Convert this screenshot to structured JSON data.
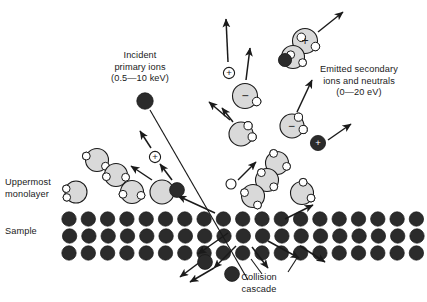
{
  "figure": {
    "type": "scientific-diagram"
  },
  "colors": {
    "dark_atom": "#2b2b2b",
    "molecule_gray": "#d9d9d9",
    "satellite_white": "#ffffff",
    "outline": "#1a1a1a",
    "background": "#ffffff",
    "text": "#1a1a1a"
  },
  "labels": {
    "incident": {
      "line1": "Incident",
      "line2": "primary ions",
      "line3": "(0.5—10 keV)",
      "text": "Incident\nprimary ions\n(0.5—10 keV)"
    },
    "emitted": {
      "line1": "Emitted secondary",
      "line2": "ions and neutrals",
      "line3": "(0—20 eV)",
      "text": "Emitted secondary\nions and neutrals\n(0—20 eV)"
    },
    "uppermost": {
      "line1": "Uppermost",
      "line2": "monolayer",
      "text": "Uppermost\nmonolayer"
    },
    "sample": {
      "text": "Sample"
    },
    "collision": {
      "line1": "Collision",
      "line2": "cascade",
      "text": "Collision\ncascade"
    }
  },
  "charge_symbols": {
    "plus": "+",
    "minus": "−"
  },
  "lattice": {
    "rows": 3,
    "description": "three staggered rows of dark substrate atoms",
    "row_y": [
      219,
      236,
      253
    ],
    "atom_radius": 7.2,
    "spacing": 19.3,
    "row_offsets": [
      0,
      9.6,
      0
    ],
    "row_counts": [
      20,
      20,
      20
    ],
    "row_start_x": [
      69,
      60,
      69
    ]
  },
  "dark_atoms": [
    {
      "name": "incident-primary-ion",
      "x": 145,
      "y": 101,
      "r": 8.2,
      "charge": ""
    },
    {
      "name": "recoil-atom-surface",
      "x": 177,
      "y": 190,
      "r": 7.4,
      "charge": ""
    },
    {
      "name": "emitted-positive-ion",
      "x": 318,
      "y": 143,
      "r": 7.6,
      "charge": "+"
    },
    {
      "name": "cluster-dark-atom",
      "x": 285,
      "y": 60,
      "r": 6.6,
      "charge": ""
    },
    {
      "name": "ejected-atom-lower-left",
      "x": 205,
      "y": 262,
      "r": 7.4,
      "charge": ""
    },
    {
      "name": "ejected-atom-bottom",
      "x": 232,
      "y": 274,
      "r": 7.4,
      "charge": ""
    }
  ],
  "molecules": [
    {
      "name": "monolayer-molecule-a",
      "x": 97,
      "y": 160,
      "r": 11.5,
      "charge": "",
      "satellites": [
        [
          -0.95,
          -0.35
        ],
        [
          0.75,
          0.55
        ]
      ]
    },
    {
      "name": "monolayer-molecule-b",
      "x": 116,
      "y": 175,
      "r": 11.5,
      "charge": "",
      "satellites": [
        [
          -0.85,
          0.15
        ],
        [
          0.85,
          0.2
        ]
      ]
    },
    {
      "name": "monolayer-molecule-c",
      "x": 132,
      "y": 192,
      "r": 11.5,
      "charge": "",
      "satellites": [
        [
          -0.8,
          0.2
        ],
        [
          0.8,
          0.3
        ]
      ]
    },
    {
      "name": "monolayer-molecule-d",
      "x": 76,
      "y": 192,
      "r": 11.0,
      "charge": "",
      "satellites": [
        [
          -0.9,
          -0.3
        ],
        [
          -0.85,
          0.5
        ]
      ]
    },
    {
      "name": "sputtered-plain-molecule",
      "x": 162,
      "y": 192,
      "r": 12.0,
      "charge": "",
      "satellites": []
    },
    {
      "name": "negative-ion-upper",
      "x": 245,
      "y": 96,
      "r": 12.5,
      "charge": "−",
      "satellites": [
        [
          0.95,
          0.45
        ]
      ]
    },
    {
      "name": "neutral-molecule-mid",
      "x": 241,
      "y": 134,
      "r": 12.0,
      "charge": "",
      "satellites": [
        [
          0.6,
          -0.7
        ],
        [
          0.95,
          0.25
        ]
      ]
    },
    {
      "name": "negative-ion-right",
      "x": 292,
      "y": 126,
      "r": 12.0,
      "charge": "−",
      "satellites": [
        [
          0.55,
          -0.75
        ],
        [
          0.95,
          0.3
        ]
      ]
    },
    {
      "name": "cluster-molecule-top",
      "x": 305,
      "y": 41,
      "r": 12.5,
      "charge": "+",
      "satellites": [
        [
          -0.3,
          -0.3
        ],
        [
          0.85,
          0.45
        ]
      ]
    },
    {
      "name": "cluster-molecule-bottom",
      "x": 293,
      "y": 57,
      "r": 11.5,
      "charge": "",
      "satellites": [
        [
          -0.2,
          -0.2
        ],
        [
          0.85,
          0.5
        ]
      ]
    },
    {
      "name": "monolayer-molecule-e",
      "x": 277,
      "y": 163,
      "r": 11.5,
      "charge": "",
      "satellites": [
        [
          -0.3,
          -0.85
        ],
        [
          0.85,
          0.3
        ]
      ]
    },
    {
      "name": "monolayer-molecule-f",
      "x": 267,
      "y": 180,
      "r": 11.5,
      "charge": "",
      "satellites": [
        [
          -0.5,
          -0.65
        ],
        [
          0.6,
          0.6
        ]
      ]
    },
    {
      "name": "monolayer-molecule-g",
      "x": 253,
      "y": 196,
      "r": 11.5,
      "charge": "",
      "satellites": [
        [
          -0.75,
          -0.3
        ],
        [
          0.4,
          0.8
        ]
      ]
    },
    {
      "name": "monolayer-molecule-h",
      "x": 302,
      "y": 193,
      "r": 11.5,
      "charge": "",
      "satellites": [
        [
          0.1,
          -0.95
        ],
        [
          0.8,
          0.45
        ]
      ]
    }
  ],
  "charge_bubbles": [
    {
      "name": "positive-ion-upper",
      "x": 229,
      "y": 73,
      "r": 5.6,
      "charge": "+"
    },
    {
      "name": "positive-ion-left",
      "x": 155,
      "y": 157,
      "r": 5.6,
      "charge": "+"
    }
  ],
  "small_neutrals": [
    {
      "name": "neutral-atom-small",
      "x": 231,
      "y": 184,
      "r": 5.0
    }
  ],
  "primary_beam": {
    "name": "primary-ion-trajectory",
    "from": [
      150,
      110
    ],
    "to": [
      248,
      280
    ]
  },
  "arrows": [
    {
      "name": "ejection-arrow-up-1",
      "from": [
        228,
        62
      ],
      "to": [
        226,
        19
      ]
    },
    {
      "name": "ejection-arrow-up-2",
      "from": [
        246,
        80
      ],
      "to": [
        250,
        48
      ]
    },
    {
      "name": "ejection-arrow-cluster",
      "from": [
        318,
        32
      ],
      "to": [
        343,
        12
      ]
    },
    {
      "name": "ejection-arrow-neg-left",
      "from": [
        230,
        120
      ],
      "to": [
        209,
        102
      ]
    },
    {
      "name": "ejection-arrow-neutral",
      "from": [
        233,
        122
      ],
      "to": [
        222,
        108
      ]
    },
    {
      "name": "ejection-arrow-negright",
      "from": [
        297,
        112
      ],
      "to": [
        312,
        80
      ]
    },
    {
      "name": "ejection-arrow-posion",
      "from": [
        328,
        140
      ],
      "to": [
        351,
        124
      ]
    },
    {
      "name": "ejection-arrow-smallneutral",
      "from": [
        238,
        180
      ],
      "to": [
        256,
        162
      ]
    },
    {
      "name": "ejection-arrow-plainmol",
      "from": [
        152,
        180
      ],
      "to": [
        131,
        166
      ]
    },
    {
      "name": "ejection-arrow-recoil",
      "from": [
        172,
        180
      ],
      "to": [
        160,
        164
      ]
    },
    {
      "name": "ejection-arrow-posleft",
      "from": [
        151,
        148
      ],
      "to": [
        140,
        131
      ]
    },
    {
      "name": "cascade-arrow-surface-left",
      "from": [
        215,
        213
      ],
      "to": [
        178,
        196
      ]
    },
    {
      "name": "cascade-arrow-surface-right",
      "from": [
        285,
        219
      ],
      "to": [
        313,
        205
      ]
    },
    {
      "name": "cascade-arrow-down-1",
      "from": [
        228,
        233
      ],
      "to": [
        198,
        254
      ]
    },
    {
      "name": "cascade-arrow-down-2",
      "from": [
        236,
        246
      ],
      "to": [
        214,
        268
      ]
    },
    {
      "name": "cascade-arrow-down-3",
      "from": [
        200,
        262
      ],
      "to": [
        180,
        277
      ]
    },
    {
      "name": "cascade-arrow-down-4",
      "from": [
        252,
        247
      ],
      "to": [
        268,
        268
      ]
    },
    {
      "name": "cascade-arrow-right-1",
      "from": [
        268,
        241
      ],
      "to": [
        299,
        258
      ]
    },
    {
      "name": "cascade-arrow-right-2",
      "from": [
        300,
        246
      ],
      "to": [
        325,
        262
      ]
    },
    {
      "name": "cascade-arrow-bottom-left",
      "from": [
        214,
        268
      ],
      "to": [
        190,
        282
      ]
    }
  ],
  "leaders": [
    {
      "name": "leader-collision-cascade",
      "from": [
        262,
        274
      ],
      "to": [
        251,
        259
      ]
    },
    {
      "name": "leader-collision-cascade-2",
      "from": [
        288,
        272
      ],
      "to": [
        297,
        258
      ]
    }
  ]
}
